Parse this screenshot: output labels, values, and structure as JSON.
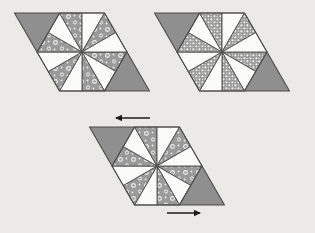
{
  "figure": {
    "background_color": "#eceae6",
    "canvas": {
      "width": 315,
      "height": 233
    }
  },
  "palette": {
    "gray_fill": "#8f8f8f",
    "white_fill": "#fbfbfa",
    "dot_fill": "#9a9a9a",
    "dot_mark": "#f2f2f0",
    "outline": "#4a4a4a",
    "arrow_color": "#1a1a1a",
    "background": "#eceae6"
  },
  "groups": [
    {
      "id": "group-top-left",
      "name": "top-left-arrangement",
      "shape": "hexagon-with-two-triangles",
      "origin": {
        "x": 82,
        "y": 52
      },
      "hexagon_radius": 45,
      "texture": "ring-dots",
      "left_triangle": {
        "orientation": "down",
        "fill": "gray"
      },
      "right_triangle": {
        "orientation": "up",
        "fill": "gray"
      },
      "wedges": [
        {
          "index": 0,
          "fill": "dots"
        },
        {
          "index": 1,
          "fill": "white"
        },
        {
          "index": 2,
          "fill": "dots"
        },
        {
          "index": 3,
          "fill": "white"
        },
        {
          "index": 4,
          "fill": "dots"
        },
        {
          "index": 5,
          "fill": "white"
        },
        {
          "index": 6,
          "fill": "dots"
        },
        {
          "index": 7,
          "fill": "white"
        },
        {
          "index": 8,
          "fill": "dots"
        },
        {
          "index": 9,
          "fill": "white"
        },
        {
          "index": 10,
          "fill": "dots"
        },
        {
          "index": 11,
          "fill": "white"
        }
      ]
    },
    {
      "id": "group-top-right",
      "name": "top-right-arrangement",
      "shape": "hexagon-with-two-triangles",
      "origin": {
        "x": 222,
        "y": 52
      },
      "hexagon_radius": 45,
      "texture": "fine-dots",
      "left_triangle": {
        "orientation": "down",
        "fill": "gray"
      },
      "right_triangle": {
        "orientation": "up",
        "fill": "gray"
      },
      "wedges": [
        {
          "index": 0,
          "fill": "dots"
        },
        {
          "index": 1,
          "fill": "white"
        },
        {
          "index": 2,
          "fill": "dots"
        },
        {
          "index": 3,
          "fill": "white"
        },
        {
          "index": 4,
          "fill": "dots"
        },
        {
          "index": 5,
          "fill": "white"
        },
        {
          "index": 6,
          "fill": "dots"
        },
        {
          "index": 7,
          "fill": "white"
        },
        {
          "index": 8,
          "fill": "dots"
        },
        {
          "index": 9,
          "fill": "white"
        },
        {
          "index": 10,
          "fill": "dots"
        },
        {
          "index": 11,
          "fill": "white"
        }
      ]
    },
    {
      "id": "group-bottom",
      "name": "bottom-parallelogram-arrangement",
      "shape": "parallelogram",
      "origin": {
        "x": 157,
        "y": 166
      },
      "hexagon_radius": 45,
      "texture": "ring-dots",
      "left_triangle": {
        "orientation": "down",
        "fill": "gray"
      },
      "right_triangle": {
        "orientation": "up",
        "fill": "gray"
      },
      "wedges": [
        {
          "index": 0,
          "fill": "dots"
        },
        {
          "index": 1,
          "fill": "white"
        },
        {
          "index": 2,
          "fill": "dots"
        },
        {
          "index": 3,
          "fill": "white"
        },
        {
          "index": 4,
          "fill": "dots"
        },
        {
          "index": 5,
          "fill": "white"
        },
        {
          "index": 6,
          "fill": "dots"
        },
        {
          "index": 7,
          "fill": "white"
        },
        {
          "index": 8,
          "fill": "dots"
        },
        {
          "index": 9,
          "fill": "white"
        },
        {
          "index": 10,
          "fill": "dots"
        },
        {
          "index": 11,
          "fill": "white"
        }
      ]
    }
  ],
  "arrows": [
    {
      "id": "arrow-top",
      "name": "arrow-left",
      "direction": "left",
      "label": "",
      "x1": 150,
      "y1": 118,
      "x2": 116,
      "y2": 118
    },
    {
      "id": "arrow-bottom",
      "name": "arrow-right",
      "direction": "right",
      "label": "",
      "x1": 167,
      "y1": 213,
      "x2": 200,
      "y2": 213
    }
  ]
}
